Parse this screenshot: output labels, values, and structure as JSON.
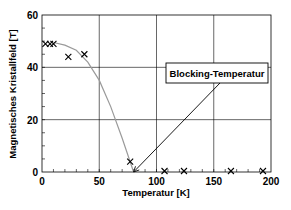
{
  "chart_data": {
    "type": "scatter",
    "title": "",
    "xlabel": "Temperatur [K]",
    "ylabel": "Magnetisches Kristallfeld [T]",
    "xlim": [
      0,
      200
    ],
    "ylim": [
      0,
      60
    ],
    "xticks": [
      0,
      50,
      100,
      150,
      200
    ],
    "yticks": [
      0,
      20,
      40,
      60
    ],
    "grid": true,
    "series": [
      {
        "name": "Messwerte",
        "marker": "x",
        "x": [
          3,
          7,
          10,
          23,
          37,
          77,
          107,
          124,
          165,
          193
        ],
        "y": [
          49,
          49,
          49,
          44,
          45,
          4,
          0,
          0,
          0,
          0
        ]
      },
      {
        "name": "Fitkurve",
        "marker": "line",
        "color": "#999999",
        "x": [
          10,
          20,
          30,
          40,
          50,
          60,
          70,
          80
        ],
        "y": [
          49.5,
          48.5,
          46.5,
          42,
          35,
          25,
          13,
          0
        ]
      }
    ],
    "annotations": [
      {
        "text": "Blocking-Temperatur",
        "points_to": [
          80,
          0
        ]
      }
    ]
  },
  "labels": {
    "xlabel": "Temperatur [K]",
    "ylabel": "Magnetisches Kristallfeld [T]",
    "annotation": "Blocking-Temperatur",
    "xticks": [
      "0",
      "50",
      "100",
      "150",
      "200"
    ],
    "yticks": [
      "0",
      "20",
      "40",
      "60"
    ]
  }
}
